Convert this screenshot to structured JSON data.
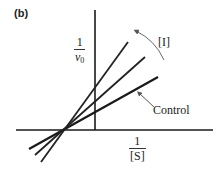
{
  "figure": {
    "panel_label": "(b)",
    "type": "Lineweaver-Burk double-reciprocal plot",
    "y_axis_label": {
      "numerator": "1",
      "denominator": "v",
      "subscript": "0"
    },
    "x_axis_label": {
      "numerator": "1",
      "denominator": "[S]"
    },
    "inhibitor_label": "[I]",
    "control_label": "Control",
    "colors": {
      "line": "#1a1a1a",
      "axis": "#1a1a1a",
      "arrow": "#555555",
      "text": "#222222"
    },
    "lines": [
      {
        "name": "control",
        "x1": 29,
        "y1": 149,
        "x2": 158,
        "y2": 77,
        "width": 2.2
      },
      {
        "name": "inhibited-medium",
        "x1": 35,
        "y1": 155,
        "x2": 145,
        "y2": 57,
        "width": 1.8
      },
      {
        "name": "inhibited-high",
        "x1": 41,
        "y1": 162,
        "x2": 128,
        "y2": 42,
        "width": 1.8
      }
    ],
    "axes": {
      "x": {
        "x1": 16,
        "y1": 130,
        "x2": 213,
        "y2": 130
      },
      "y": {
        "x1": 95,
        "y1": 10,
        "x2": 95,
        "y2": 130
      }
    },
    "intersection": {
      "x": 62,
      "y": 132,
      "note": "lines intersect on the x-axis (noncompetitive inhibition)"
    }
  }
}
